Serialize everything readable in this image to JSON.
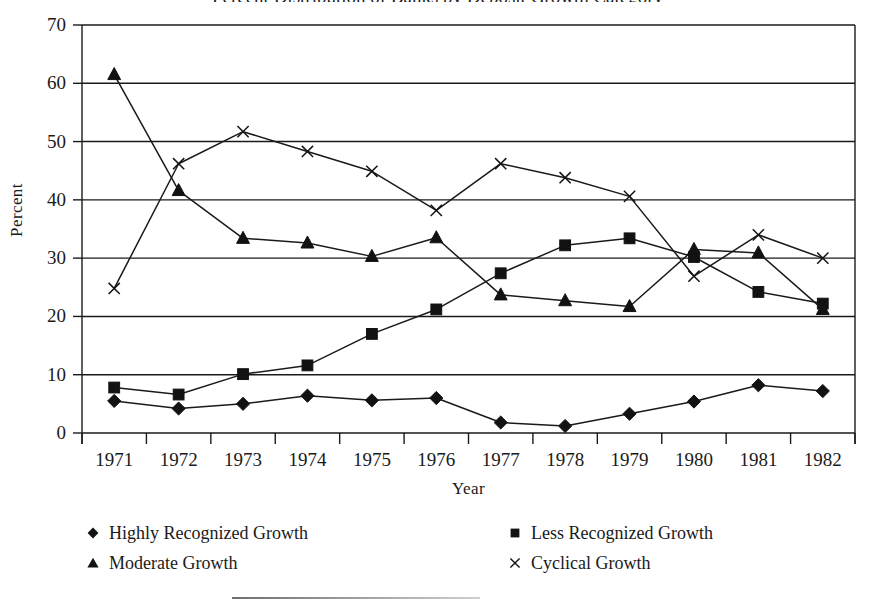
{
  "figure": {
    "clipped_top_title": "Percent Distribution of Banks by Deposit Growth Category",
    "ylabel": "Percent",
    "xlabel": "Year"
  },
  "legend": {
    "entries": [
      {
        "label": "Highly Recognized Growth",
        "marker": "diamond-marker-icon",
        "column": 1,
        "row": 1
      },
      {
        "label": "Less Recognized Growth",
        "marker": "square-marker-icon",
        "column": 2,
        "row": 1
      },
      {
        "label": "Moderate Growth",
        "marker": "triangle-marker-icon",
        "column": 1,
        "row": 2
      },
      {
        "label": "Cyclical Growth",
        "marker": "cross-marker-icon",
        "column": 2,
        "row": 2
      }
    ]
  },
  "chart_data": {
    "type": "line",
    "title": "",
    "xlabel": "Year",
    "ylabel": "Percent",
    "x": [
      1971,
      1972,
      1973,
      1974,
      1975,
      1976,
      1977,
      1978,
      1979,
      1980,
      1981,
      1982
    ],
    "categories": [
      "1971",
      "1972",
      "1973",
      "1974",
      "1975",
      "1976",
      "1977",
      "1978",
      "1979",
      "1980",
      "1981",
      "1982"
    ],
    "xlim": [
      1971,
      1982
    ],
    "ylim": [
      0,
      70
    ],
    "yticks": [
      0,
      10,
      20,
      30,
      40,
      50,
      60,
      70
    ],
    "ytick_labels": [
      "0",
      "10",
      "20",
      "30",
      "40",
      "50",
      "60",
      "70"
    ],
    "grid": "horizontal",
    "legend_position": "below",
    "line_color": "#1a1a1a",
    "series": [
      {
        "name": "Highly Recognized Growth",
        "marker": "diamond",
        "values": [
          5.5,
          4.2,
          5.0,
          6.4,
          5.6,
          6.0,
          1.8,
          1.2,
          3.3,
          5.4,
          8.2,
          7.2
        ]
      },
      {
        "name": "Less Recognized Growth",
        "marker": "square",
        "values": [
          7.8,
          6.6,
          10.1,
          11.6,
          17.0,
          21.2,
          27.4,
          32.2,
          33.4,
          30.2,
          24.2,
          22.2
        ]
      },
      {
        "name": "Moderate Growth",
        "marker": "triangle",
        "values": [
          61.5,
          41.6,
          33.4,
          32.6,
          30.3,
          33.5,
          23.7,
          22.7,
          21.7,
          31.5,
          30.9,
          21.2
        ]
      },
      {
        "name": "Cyclical Growth",
        "marker": "cross",
        "values": [
          24.8,
          46.2,
          51.7,
          48.3,
          44.9,
          38.2,
          46.2,
          43.8,
          40.6,
          26.9,
          34.0,
          30.0
        ]
      }
    ]
  }
}
